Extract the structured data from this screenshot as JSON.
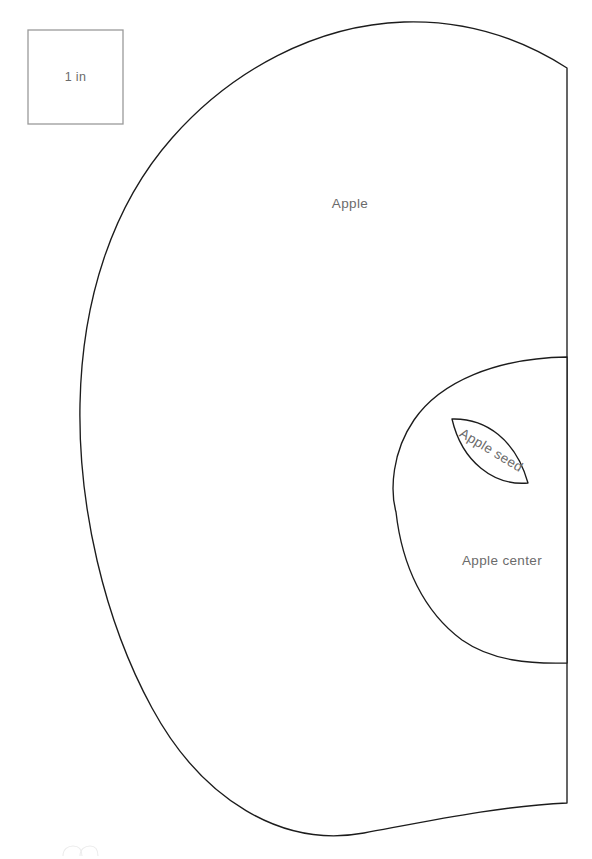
{
  "document": {
    "kind": "sewing-pattern-template",
    "title": "Apple pattern pieces",
    "page_width": 592,
    "page_height": 859,
    "background_color": "#ffffff",
    "outline_color": "#1c1c1c",
    "label_color": "#6b6b6b",
    "scale_box_color": "#9a9a9a"
  },
  "scale_reference": {
    "label": "1 in",
    "x": 28,
    "y": 30,
    "width": 95,
    "height": 94
  },
  "pieces": [
    {
      "id": "apple-body",
      "label": "Apple",
      "label_x": 350,
      "label_y": 208,
      "label_rotation": 0,
      "fold_edge": "right",
      "path": "M 567 68 C 520 38 466 20 404 22 C 316 25 232 70 172 138 C 112 206 82 300 80 404 C 78 506 104 620 152 708 C 202 800 282 848 364 833 C 434 820 500 806 567 803 L 567 68 Z"
    },
    {
      "id": "apple-center",
      "label": "Apple center",
      "label_x": 502,
      "label_y": 565,
      "label_rotation": 0,
      "fold_edge": "right",
      "path": "M 567 357 C 496 358 440 382 414 420 C 392 452 390 490 396 512 C 402 566 424 612 462 640 C 492 661 530 664 567 663 Z"
    },
    {
      "id": "apple-seed",
      "label": "Apple seed",
      "label_x": 489,
      "label_y": 454,
      "label_rotation": 31,
      "fold_edge": "none",
      "path": "M 452 419 C 486 418 516 440 528 483 C 494 486 462 462 452 419 Z"
    }
  ],
  "watermark": {
    "visible": true,
    "x": 62,
    "y": 846,
    "description": "faint cropped logo mark"
  }
}
